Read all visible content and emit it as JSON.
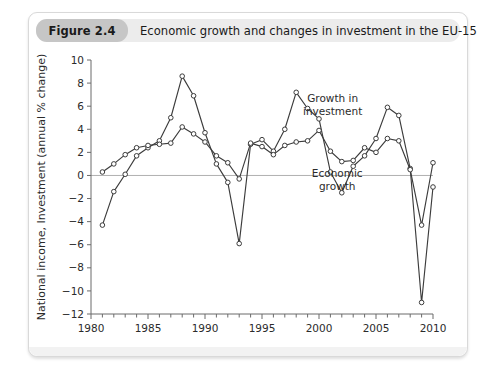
{
  "figure": {
    "number_label": "Figure 2.4",
    "title": "Economic growth and changes in investment in the EU-15"
  },
  "chart_data": {
    "type": "line",
    "title": "Economic growth and changes in investment in the EU-15",
    "xlabel": "",
    "ylabel": "National income, Investment (annual % change)",
    "xlim": [
      1980,
      2010
    ],
    "ylim": [
      -12,
      10
    ],
    "xticks": [
      1980,
      1985,
      1990,
      1995,
      2000,
      2005,
      2010
    ],
    "xtick_labels": [
      "1980",
      "1985",
      "1990",
      "1995",
      "2000",
      "2005",
      "2010"
    ],
    "x_minor_tick_step": 1,
    "yticks": [
      -12,
      -10,
      -8,
      -6,
      -4,
      -2,
      0,
      2,
      4,
      6,
      8,
      10
    ],
    "ytick_labels": [
      "-12",
      "-10",
      "-8",
      "-6",
      "-4",
      "-2",
      "0",
      "2",
      "4",
      "6",
      "8",
      "10"
    ],
    "grid": false,
    "zero_line": true,
    "legend_position": "inline-annotations",
    "marker": "open-circle",
    "line_color": "#3c3c3c",
    "x": [
      1981,
      1982,
      1983,
      1984,
      1985,
      1986,
      1987,
      1988,
      1989,
      1990,
      1991,
      1992,
      1993,
      1994,
      1995,
      1996,
      1997,
      1998,
      1999,
      2000,
      2001,
      2002,
      2003,
      2004,
      2005,
      2006,
      2007,
      2008,
      2009,
      2010
    ],
    "series": [
      {
        "name": "Growth in investment",
        "annotation": "Growth in\ninvestment",
        "values": [
          -4.3,
          -1.4,
          0.1,
          1.7,
          2.4,
          3.0,
          5.0,
          8.6,
          6.9,
          3.7,
          1.0,
          -0.6,
          -5.9,
          2.7,
          3.1,
          2.1,
          4.0,
          7.2,
          5.8,
          4.9,
          0.3,
          -1.5,
          0.8,
          1.7,
          3.2,
          5.9,
          5.2,
          0.6,
          -11.0,
          -1.0
        ]
      },
      {
        "name": "Economic growth",
        "annotation": "Economic\ngrowth",
        "values": [
          0.3,
          1.0,
          1.8,
          2.4,
          2.6,
          2.7,
          2.8,
          4.2,
          3.6,
          2.9,
          1.7,
          1.1,
          -0.3,
          2.8,
          2.5,
          1.8,
          2.6,
          2.9,
          3.0,
          3.9,
          2.1,
          1.2,
          1.3,
          2.4,
          2.0,
          3.2,
          3.0,
          0.5,
          -4.3,
          1.1
        ]
      }
    ],
    "annotations": [
      {
        "text_line1": "Growth in",
        "text_line2": "investment",
        "x": 2001.2,
        "y": 6.4
      },
      {
        "text_line1": "Economic",
        "text_line2": "growth",
        "x": 2001.6,
        "y": -0.1
      }
    ]
  }
}
